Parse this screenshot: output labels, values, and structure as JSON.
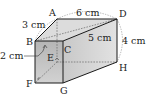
{
  "diagram": {
    "type": "rectangular-prism",
    "vertices": {
      "A": {
        "label": "A",
        "x": 57,
        "y": 19
      },
      "B": {
        "label": "B",
        "x": 35,
        "y": 41
      },
      "C": {
        "label": "C",
        "x": 63,
        "y": 41
      },
      "D": {
        "label": "D",
        "x": 117,
        "y": 19
      },
      "E": {
        "label": "E",
        "x": 57,
        "y": 62
      },
      "F": {
        "label": "F",
        "x": 35,
        "y": 83
      },
      "G": {
        "label": "G",
        "x": 63,
        "y": 83
      },
      "H": {
        "label": "H",
        "x": 117,
        "y": 62
      }
    },
    "measurements": {
      "ad": "6 cm",
      "ab": "3 cm",
      "bd": "5 cm",
      "dh": "4 cm",
      "be": "2 cm"
    },
    "colors": {
      "top_face": "#d9d9d9",
      "front_face": "#bdbdbd",
      "side_face": "#cfcfcf",
      "edge": "#1a1a1a",
      "dashed": "#666666"
    }
  }
}
